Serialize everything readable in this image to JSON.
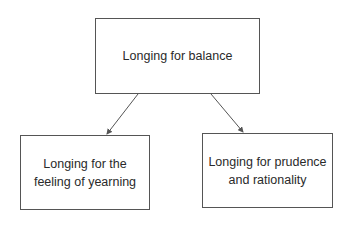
{
  "diagram": {
    "type": "tree",
    "nodes": [
      {
        "id": "root",
        "label": "Longing for balance"
      },
      {
        "id": "left",
        "label": "Longing for the feeling of yearning"
      },
      {
        "id": "right",
        "label": "Longing for prudence and rationality"
      }
    ],
    "edges": [
      {
        "from": "root",
        "to": "left"
      },
      {
        "from": "root",
        "to": "right"
      }
    ],
    "colors": {
      "stroke": "#555555",
      "text": "#2a2a2a",
      "background": "#ffffff"
    }
  }
}
